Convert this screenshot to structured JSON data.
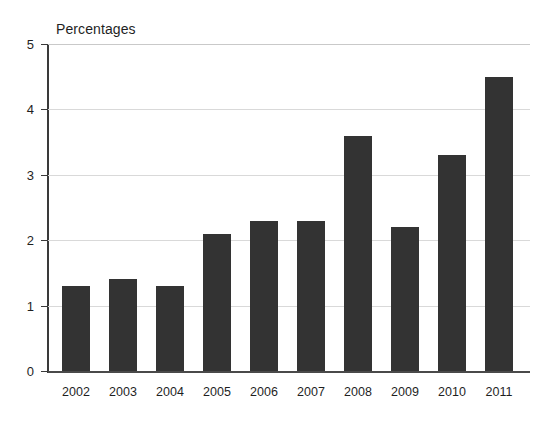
{
  "chart_data": {
    "type": "bar",
    "title": "Percentages",
    "xlabel": "",
    "ylabel": "",
    "categories": [
      "2002",
      "2003",
      "2004",
      "2005",
      "2006",
      "2007",
      "2008",
      "2009",
      "2010",
      "2011"
    ],
    "values": [
      1.3,
      1.4,
      1.3,
      2.1,
      2.3,
      2.3,
      3.6,
      2.2,
      3.3,
      4.5
    ],
    "ylim": [
      0,
      5
    ],
    "ytick_labels": [
      "0",
      "1",
      "2",
      "3",
      "4",
      "5"
    ],
    "ytick_values": [
      0,
      1,
      2,
      3,
      4,
      5
    ],
    "grid": "horizontal",
    "legend": "none",
    "bar_color": "#333333",
    "gridline_color": "#d9d9d9",
    "axis_color": "#3a3a3a",
    "background_color": "#ffffff"
  }
}
